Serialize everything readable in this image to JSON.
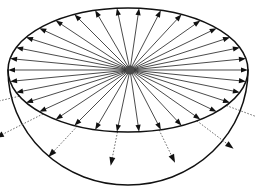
{
  "figure": {
    "title": "Radial vector field on a hemispherical disk",
    "background_color": "#ffffff",
    "canvas": {
      "width": 256,
      "height": 193
    }
  },
  "geometry": {
    "center": {
      "x": 130,
      "y": 70,
      "label": "origin-hub"
    },
    "disk_ellipse": {
      "cx": 128,
      "cy": 70,
      "rx": 120,
      "ry": 62,
      "stroke_color": "#111111",
      "stroke_width": 1.5,
      "name": "disk-rim"
    },
    "bowl_arc": {
      "start": {
        "x": 8,
        "y": 70
      },
      "end": {
        "x": 248,
        "y": 70
      },
      "rx": 120,
      "ry": 115,
      "bottom_y": 185,
      "stroke_color": "#111111",
      "stroke_width": 1.5,
      "name": "hemisphere-lower-arc"
    },
    "hub_radius": 4.5,
    "hub_color": "#4a4a4a"
  },
  "style": {
    "solid_ray_color": "#2b2b2b",
    "dotted_ray_color": "#555555",
    "ray_width": 0.85,
    "arrowhead_color": "#111111",
    "dash_pattern": "1.6 1.6"
  },
  "rays": {
    "count": 34,
    "angle_start_deg": 0,
    "angle_step_deg": 10.588,
    "note": "Rays emanate from the hub at evenly spaced angles and terminate with a filled triangular arrowhead on the disk rim. Rays in the lower half also continue past the rim as dotted segments into the bowl.",
    "dotted_extension": {
      "present": true,
      "angles_deg": [
        205,
        225,
        245,
        265,
        285,
        305,
        325
      ],
      "extension_factor": 1.55
    }
  },
  "legend": {
    "solid_label": "",
    "dotted_label": "",
    "visible": false
  }
}
